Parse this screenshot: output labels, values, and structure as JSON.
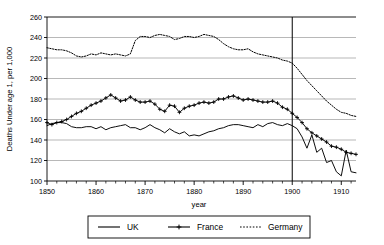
{
  "chart_data": {
    "type": "line",
    "title": "",
    "xlabel": "year",
    "ylabel": "Deaths Under age 1, per 1,000",
    "xlim": [
      1850,
      1913
    ],
    "ylim": [
      100,
      260
    ],
    "grid": true,
    "legend_position": "bottom",
    "xticks": [
      1850,
      1860,
      1870,
      1880,
      1890,
      1900,
      1910
    ],
    "xtick_labels": [
      "1850",
      "1860",
      "1870",
      "1880",
      "1890",
      "1900",
      "1910"
    ],
    "yticks": [
      100,
      120,
      140,
      160,
      180,
      200,
      220,
      240,
      260
    ],
    "ytick_labels": [
      "100",
      "120",
      "140",
      "160",
      "180",
      "200",
      "220",
      "240",
      "260"
    ],
    "annotations": [
      {
        "name": "vertical-reference-line-1900",
        "type": "vline",
        "x": 1900
      }
    ],
    "x": [
      1850,
      1851,
      1852,
      1853,
      1854,
      1855,
      1856,
      1857,
      1858,
      1859,
      1860,
      1861,
      1862,
      1863,
      1864,
      1865,
      1866,
      1867,
      1868,
      1869,
      1870,
      1871,
      1872,
      1873,
      1874,
      1875,
      1876,
      1877,
      1878,
      1879,
      1880,
      1881,
      1882,
      1883,
      1884,
      1885,
      1886,
      1887,
      1888,
      1889,
      1890,
      1891,
      1892,
      1893,
      1894,
      1895,
      1896,
      1897,
      1898,
      1899,
      1900,
      1901,
      1902,
      1903,
      1904,
      1905,
      1906,
      1907,
      1908,
      1909,
      1910,
      1911,
      1912,
      1913
    ],
    "series": [
      {
        "name": "UK",
        "style": "solid",
        "marker": "none",
        "color": "#000000",
        "values": [
          154,
          156,
          157,
          157,
          156,
          153,
          152,
          152,
          153,
          153,
          151,
          153,
          150,
          152,
          153,
          154,
          155,
          152,
          152,
          150,
          152,
          155,
          152,
          150,
          147,
          151,
          148,
          146,
          148,
          144,
          145,
          144,
          146,
          148,
          149,
          151,
          152,
          154,
          155,
          155,
          154,
          153,
          152,
          155,
          153,
          156,
          157,
          155,
          154,
          156,
          154,
          151,
          143,
          132,
          145,
          128,
          132,
          118,
          120,
          109,
          105,
          130,
          109,
          108
        ]
      },
      {
        "name": "France",
        "style": "solid",
        "marker": "plus",
        "color": "#000000",
        "values": [
          157,
          155,
          157,
          158,
          160,
          163,
          166,
          168,
          171,
          174,
          176,
          178,
          181,
          184,
          181,
          178,
          179,
          182,
          179,
          177,
          177,
          178,
          175,
          170,
          168,
          174,
          173,
          167,
          171,
          173,
          174,
          176,
          177,
          176,
          177,
          180,
          180,
          182,
          183,
          181,
          179,
          180,
          179,
          178,
          177,
          177,
          178,
          176,
          172,
          170,
          166,
          162,
          157,
          151,
          147,
          144,
          141,
          138,
          134,
          133,
          131,
          128,
          127,
          126
        ]
      },
      {
        "name": "Germany",
        "style": "dotted",
        "marker": "none",
        "color": "#000000",
        "values": [
          230,
          229,
          228,
          228,
          227,
          225,
          222,
          221,
          222,
          224,
          223,
          225,
          224,
          223,
          224,
          223,
          222,
          224,
          237,
          241,
          241,
          240,
          242,
          243,
          242,
          241,
          238,
          239,
          241,
          241,
          240,
          241,
          243,
          242,
          241,
          238,
          234,
          231,
          229,
          228,
          228,
          229,
          226,
          224,
          223,
          222,
          221,
          220,
          218,
          217,
          215,
          210,
          204,
          198,
          193,
          188,
          183,
          178,
          174,
          170,
          167,
          166,
          164,
          163
        ]
      }
    ]
  },
  "legend": {
    "items": [
      {
        "label": "UK",
        "style": "solid",
        "marker": "none"
      },
      {
        "label": "France",
        "style": "solid",
        "marker": "plus"
      },
      {
        "label": "Germany",
        "style": "dotted",
        "marker": "none"
      }
    ]
  }
}
